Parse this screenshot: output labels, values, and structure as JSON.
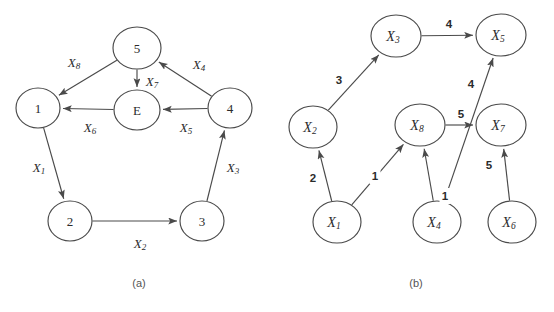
{
  "figure": {
    "background_color": "#ffffff",
    "stroke_color": "#4a4a4a",
    "text_color": "#2b2b2b",
    "caption_color": "#555555"
  },
  "panels": [
    {
      "id": "a",
      "caption": "(a)",
      "caption_x": 139,
      "caption_y": 283,
      "node_radius": 20,
      "nodes": [
        {
          "id": "1",
          "label": "1",
          "sub": "",
          "x": 38,
          "y": 108,
          "rx": 22,
          "ry": 20
        },
        {
          "id": "2",
          "label": "2",
          "sub": "",
          "x": 70,
          "y": 221,
          "rx": 22,
          "ry": 20
        },
        {
          "id": "3",
          "label": "3",
          "sub": "",
          "x": 202,
          "y": 221,
          "rx": 22,
          "ry": 20
        },
        {
          "id": "4",
          "label": "4",
          "sub": "",
          "x": 230,
          "y": 108,
          "rx": 22,
          "ry": 20
        },
        {
          "id": "5",
          "label": "5",
          "sub": "",
          "x": 137,
          "y": 48,
          "rx": 24,
          "ry": 21
        },
        {
          "id": "E",
          "label": "E",
          "sub": "",
          "x": 137,
          "y": 110,
          "rx": 23,
          "ry": 20
        }
      ],
      "edges": [
        {
          "id": "e-5-1",
          "from": "5",
          "to": "1",
          "label": "X",
          "sub": "8",
          "label_x": 74,
          "label_y": 62
        },
        {
          "id": "e-5-E",
          "from": "5",
          "to": "E",
          "label": "X",
          "sub": "7",
          "label_x": 152,
          "label_y": 81
        },
        {
          "id": "e-4-5",
          "from": "4",
          "to": "5",
          "label": "X",
          "sub": "4",
          "label_x": 199,
          "label_y": 64
        },
        {
          "id": "e-4-E",
          "from": "4",
          "to": "E",
          "label": "X",
          "sub": "5",
          "label_x": 186,
          "label_y": 127
        },
        {
          "id": "e-E-1",
          "from": "E",
          "to": "1",
          "label": "X",
          "sub": "6",
          "label_x": 90,
          "label_y": 127
        },
        {
          "id": "e-1-2",
          "from": "1",
          "to": "2",
          "label": "X",
          "sub": "1",
          "label_x": 39,
          "label_y": 167
        },
        {
          "id": "e-2-3",
          "from": "2",
          "to": "3",
          "label": "X",
          "sub": "2",
          "label_x": 140,
          "label_y": 243
        },
        {
          "id": "e-3-4",
          "from": "3",
          "to": "4",
          "label": "X",
          "sub": "3",
          "label_x": 233,
          "label_y": 167
        }
      ]
    },
    {
      "id": "b",
      "caption": "(b)",
      "caption_x": 139,
      "caption_y": 283,
      "node_radius": 21,
      "nodes": [
        {
          "id": "X1",
          "label": "X",
          "sub": "1",
          "x": 60,
          "y": 222,
          "rx": 24,
          "ry": 21
        },
        {
          "id": "X2",
          "label": "X",
          "sub": "2",
          "x": 36,
          "y": 127,
          "rx": 24,
          "ry": 21
        },
        {
          "id": "X3",
          "label": "X",
          "sub": "3",
          "x": 119,
          "y": 36,
          "rx": 25,
          "ry": 21
        },
        {
          "id": "X4",
          "label": "X",
          "sub": "4",
          "x": 160,
          "y": 222,
          "rx": 24,
          "ry": 21
        },
        {
          "id": "X5",
          "label": "X",
          "sub": "5",
          "x": 224,
          "y": 35,
          "rx": 25,
          "ry": 21
        },
        {
          "id": "X6",
          "label": "X",
          "sub": "6",
          "x": 235,
          "y": 222,
          "rx": 24,
          "ry": 21
        },
        {
          "id": "X7",
          "label": "X",
          "sub": "7",
          "x": 224,
          "y": 125,
          "rx": 25,
          "ry": 21
        },
        {
          "id": "X8",
          "label": "X",
          "sub": "8",
          "x": 143,
          "y": 125,
          "rx": 25,
          "ry": 21
        }
      ],
      "edges": [
        {
          "id": "e-x1-x2",
          "from": "X1",
          "to": "X2",
          "weight": "2",
          "label_x": 36,
          "label_y": 178
        },
        {
          "id": "e-x1-x8",
          "from": "X1",
          "to": "X8",
          "weight": "1",
          "label_x": 98,
          "label_y": 176
        },
        {
          "id": "e-x2-x3",
          "from": "X2",
          "to": "X3",
          "weight": "3",
          "label_x": 62,
          "label_y": 80
        },
        {
          "id": "e-x3-x5",
          "from": "X3",
          "to": "X5",
          "weight": "4",
          "label_x": 172,
          "label_y": 24
        },
        {
          "id": "e-x8-x7",
          "from": "X8",
          "to": "X7",
          "weight": "5",
          "label_x": 184,
          "label_y": 114
        },
        {
          "id": "e-x4-x8",
          "from": "X4",
          "to": "X8",
          "weight": "1",
          "label_x": 168,
          "label_y": 196
        },
        {
          "id": "e-x4-x5",
          "from": "X4",
          "to": "X5",
          "weight": "4",
          "label_x": 194,
          "label_y": 84
        },
        {
          "id": "e-x6-x7",
          "from": "X6",
          "to": "X7",
          "weight": "5",
          "label_x": 212,
          "label_y": 165
        }
      ]
    }
  ]
}
